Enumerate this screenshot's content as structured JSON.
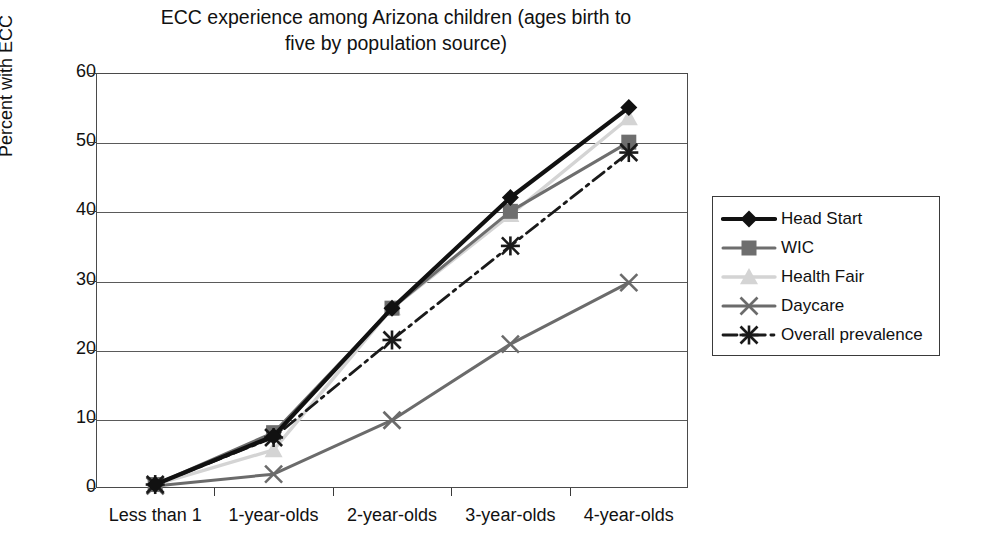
{
  "chart_data": {
    "type": "line",
    "title": "ECC experience among Arizona children (ages birth to\nfive by population source)",
    "xlabel": "",
    "ylabel": "Percent with ECC",
    "ylim": [
      0,
      60
    ],
    "ytick_step": 10,
    "yticks": [
      60,
      50,
      40,
      30,
      20,
      10,
      0
    ],
    "grid": true,
    "legend_position": "right",
    "categories": [
      "Less than 1",
      "1-year-olds",
      "2-year-olds",
      "3-year-olds",
      "4-year-olds"
    ],
    "series": [
      {
        "name": "Head Start",
        "values": [
          0.5,
          7.5,
          26.0,
          42.0,
          55.0
        ],
        "color": "#111111",
        "marker": "diamond",
        "line": "solid",
        "width": 4.2
      },
      {
        "name": "WIC",
        "values": [
          0.5,
          8.0,
          26.0,
          40.0,
          50.0
        ],
        "color": "#6e6e6e",
        "marker": "square",
        "line": "solid",
        "width": 3.0
      },
      {
        "name": "Health Fair",
        "values": [
          0.5,
          5.5,
          26.0,
          39.5,
          53.5
        ],
        "color": "#d4d4d4",
        "marker": "triangle",
        "line": "solid",
        "width": 3.4
      },
      {
        "name": "Daycare",
        "values": [
          0.3,
          2.0,
          9.8,
          20.8,
          29.7
        ],
        "color": "#6b6b6b",
        "marker": "cross",
        "line": "solid",
        "width": 3.0
      },
      {
        "name": "Overall prevalence",
        "values": [
          0.5,
          7.3,
          21.4,
          35.0,
          48.5
        ],
        "color": "#1a1a1a",
        "marker": "asterisk",
        "line": "dashdot",
        "width": 2.8
      }
    ]
  },
  "legend": {
    "entries": [
      {
        "label": "Head Start"
      },
      {
        "label": "WIC"
      },
      {
        "label": "Health Fair"
      },
      {
        "label": "Daycare"
      },
      {
        "label": "Overall prevalence"
      }
    ]
  }
}
